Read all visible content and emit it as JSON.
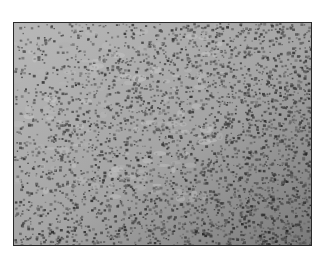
{
  "image": {
    "description": "Grayscale micrograph of densely packed cells",
    "kind": "micrograph",
    "colors": {
      "background": "#ffffff",
      "border": "#2a2a2a",
      "tissue_light": "#b4b4b4",
      "tissue_mid": "#8c8c8c",
      "cell_dark": "#4a4a4a"
    }
  }
}
